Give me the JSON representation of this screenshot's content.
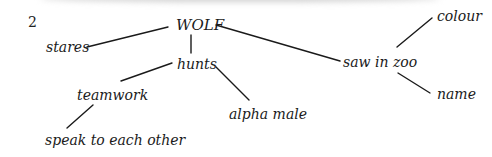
{
  "figure_number": "2",
  "diagram": {
    "type": "mind-map",
    "root": "WOLF",
    "nodes": {
      "wolf": "WOLF",
      "stares": "stares",
      "hunts": "hunts",
      "teamwork": "teamwork",
      "speak": "speak to each other",
      "alpha": "alpha male",
      "zoo": "saw in zoo",
      "colour": "colour",
      "name": "name"
    },
    "edges": [
      [
        "WOLF",
        "stares"
      ],
      [
        "WOLF",
        "hunts"
      ],
      [
        "WOLF",
        "saw in zoo"
      ],
      [
        "hunts",
        "teamwork"
      ],
      [
        "hunts",
        "alpha male"
      ],
      [
        "teamwork",
        "speak to each other"
      ],
      [
        "saw in zoo",
        "colour"
      ],
      [
        "saw in zoo",
        "name"
      ]
    ]
  }
}
